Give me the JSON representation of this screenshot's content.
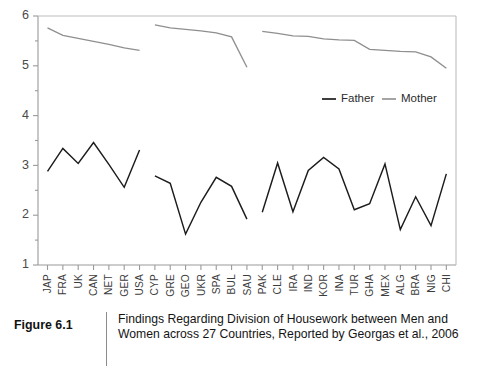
{
  "figure": {
    "number_label": "Figure 6.1",
    "caption": "Findings Regarding Division of Housework between Men and Women across 27 Countries, Reported by Georgas et al., 2006"
  },
  "legend": {
    "position": "upper-right-inside",
    "entries": [
      {
        "name": "Father",
        "color": "#1c1c1c"
      },
      {
        "name": "Mother",
        "color": "#8f8f8f"
      }
    ]
  },
  "axes": {
    "y_ticks": [
      "6",
      "5",
      "4",
      "3",
      "2",
      "1"
    ],
    "y_min": 1,
    "y_max": 6,
    "grid": false
  },
  "chart_data": {
    "type": "line",
    "title": "",
    "subtitle": "",
    "xlabel": "",
    "ylabel": "",
    "ylim": [
      1,
      6
    ],
    "grid": false,
    "legend_position": "upper right",
    "categories": [
      "JAP",
      "FRA",
      "UK",
      "CAN",
      "NET",
      "GER",
      "USA",
      "CYP",
      "GRE",
      "GEO",
      "UKR",
      "SPA",
      "BUL",
      "SAU",
      "PAK",
      "CLE",
      "IRA",
      "IND",
      "KOR",
      "INA",
      "TUR",
      "GHA",
      "MEX",
      "ALG",
      "BRA",
      "NIG",
      "CHI"
    ],
    "series": [
      {
        "name": "Father",
        "color": "#1c1c1c",
        "values": [
          2.88,
          3.34,
          3.04,
          3.46,
          3.02,
          2.56,
          3.31,
          2.79,
          2.64,
          1.62,
          2.26,
          2.76,
          2.58,
          1.92,
          2.06,
          3.05,
          2.07,
          2.9,
          3.16,
          2.93,
          2.11,
          2.23,
          3.03,
          1.71,
          2.37,
          1.79,
          2.83
        ]
      },
      {
        "name": "Mother",
        "color": "#8f8f8f",
        "values": [
          5.76,
          5.61,
          5.55,
          5.49,
          5.43,
          5.36,
          5.31,
          5.82,
          5.76,
          5.73,
          5.7,
          5.66,
          5.58,
          4.97,
          5.69,
          5.65,
          5.6,
          5.59,
          5.54,
          5.52,
          5.51,
          5.33,
          5.31,
          5.29,
          5.28,
          5.18,
          4.95
        ]
      }
    ],
    "segment_breaks": [
      6,
      13
    ]
  }
}
